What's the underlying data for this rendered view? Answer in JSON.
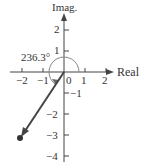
{
  "diagram": {
    "type": "complex-plane",
    "axes": {
      "x_label": "Real",
      "y_label": "Imag.",
      "x_ticks": [
        "−2",
        "−1",
        "0",
        "1",
        "2"
      ],
      "y_ticks_pos": [
        "1",
        "2"
      ],
      "y_ticks_neg": [
        "−1",
        "−2",
        "−3",
        "−4"
      ]
    },
    "angle_label": "236.3°",
    "point": {
      "re": -2,
      "im": -3
    },
    "colors": {
      "axis": "#444444",
      "vector": "#444444",
      "arc": "#888888"
    }
  }
}
